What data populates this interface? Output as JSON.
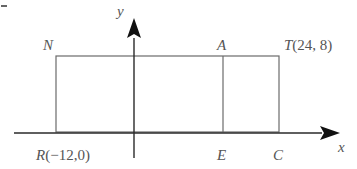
{
  "diagram": {
    "type": "coordinate-geometry",
    "axes": {
      "x_label": "x",
      "y_label": "y"
    },
    "points": {
      "N": {
        "label": "N"
      },
      "A": {
        "label": "A"
      },
      "T": {
        "label": "T",
        "coords": "(24, 8)"
      },
      "R": {
        "label": "R",
        "coords": "(−12,0)"
      },
      "E": {
        "label": "E"
      },
      "C": {
        "label": "C"
      }
    },
    "shapes": [
      {
        "name": "rectangle",
        "vertices": [
          "R",
          "N",
          "T",
          "C"
        ]
      },
      {
        "name": "segment",
        "from": "A",
        "to": "E"
      }
    ],
    "corner_mark": "-"
  },
  "colors": {
    "line": "#6b6b6b",
    "axis": "#1a1a1a",
    "text": "#555555"
  }
}
